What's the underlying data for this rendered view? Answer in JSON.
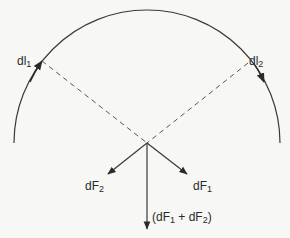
{
  "diagram": {
    "type": "magnetic-force-on-current-elements",
    "labels": {
      "dl1": {
        "base": "dl",
        "sub": "1"
      },
      "dl2": {
        "base": "dl",
        "sub": "2"
      },
      "dF1": {
        "base": "dF",
        "sub": "1"
      },
      "dF2": {
        "base": "dF",
        "sub": "2"
      },
      "sum": {
        "open": "(dF",
        "sub1": "1",
        "mid": " + dF",
        "sub2": "2",
        "close": ")"
      }
    },
    "colors": {
      "line": "#3a3a3a",
      "background": "#f7f7f5"
    }
  }
}
